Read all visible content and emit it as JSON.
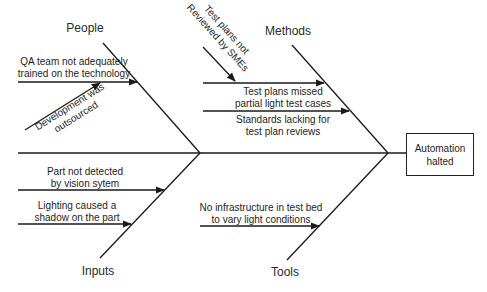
{
  "diagram": {
    "type": "fishbone",
    "effect": {
      "line1": "Automation",
      "line2": "halted"
    },
    "categories": {
      "people": "People",
      "methods": "Methods",
      "inputs": "Inputs",
      "tools": "Tools"
    },
    "causes": {
      "people": [
        {
          "line1": "QA team not adequately",
          "line2": "trained on the technology"
        },
        {
          "line1": "Development was",
          "line2": "outsourced"
        }
      ],
      "methods": [
        {
          "line1": "Test plans not",
          "line2": "Reviewed by SMEs"
        },
        {
          "line1": "Test plans missed",
          "line2": "partial light test cases"
        },
        {
          "line1": "Standards lacking for",
          "line2": "test plan reviews"
        }
      ],
      "inputs": [
        {
          "line1": "Part not detected",
          "line2": "by vision sytem"
        },
        {
          "line1": "Lighting caused a",
          "line2": "shadow on the part"
        }
      ],
      "tools": [
        {
          "line1": "No infrastructure in test bed",
          "line2": "to vary light conditions"
        }
      ]
    },
    "colors": {
      "line": "#1a1a1a",
      "text": "#1e1e1e",
      "background": "#ffffff"
    }
  }
}
